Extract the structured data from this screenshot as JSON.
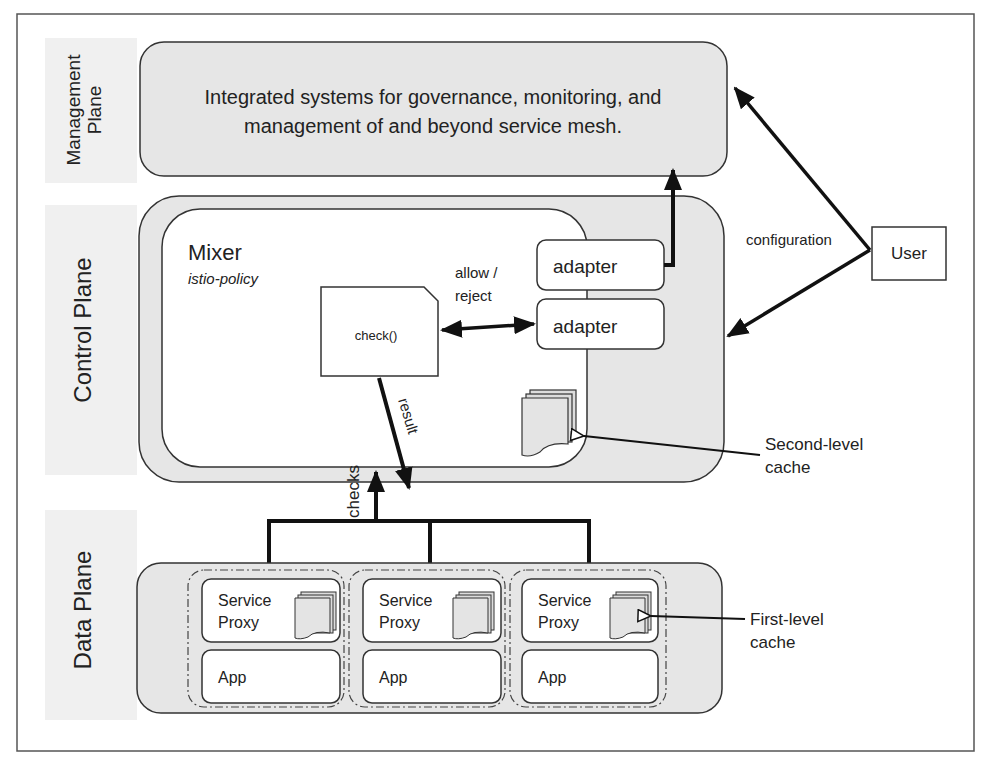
{
  "planes": {
    "management": {
      "label_line1": "Management",
      "label_line2": "Plane",
      "description_line1": "Integrated systems for governance, monitoring, and",
      "description_line2": "management of and beyond service mesh."
    },
    "control": {
      "label": "Control Plane"
    },
    "data": {
      "label": "Data Plane"
    }
  },
  "mixer": {
    "title": "Mixer",
    "subtitle": "istio-policy",
    "check_label": "check()"
  },
  "adapters": [
    {
      "label": "adapter"
    },
    {
      "label": "adapter"
    }
  ],
  "arrows": {
    "allow_reject_line1": "allow /",
    "allow_reject_line2": "reject",
    "result": "result",
    "checks": "checks",
    "configuration": "configuration"
  },
  "user": {
    "label": "User"
  },
  "caches": {
    "second_level_line1": "Second-level",
    "second_level_line2": "cache",
    "first_level_line1": "First-level",
    "first_level_line2": "cache"
  },
  "pods": [
    {
      "proxy_line1": "Service",
      "proxy_line2": "Proxy",
      "app": "App"
    },
    {
      "proxy_line1": "Service",
      "proxy_line2": "Proxy",
      "app": "App"
    },
    {
      "proxy_line1": "Service",
      "proxy_line2": "Proxy",
      "app": "App"
    }
  ],
  "colors": {
    "plane_fill": "#e6e6e6",
    "label_band": "#f0f0f0",
    "stroke": "#333333",
    "arrow": "#111111"
  }
}
